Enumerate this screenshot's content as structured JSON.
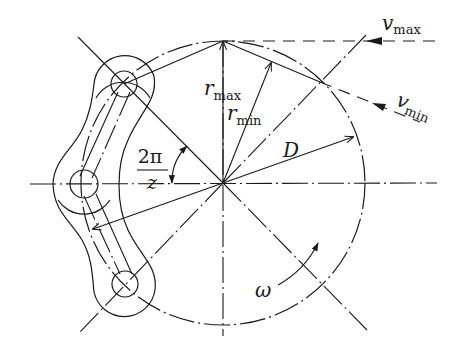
{
  "diagram": {
    "labels": {
      "r_max": {
        "base": "r",
        "sub": "max"
      },
      "r_min": {
        "base": "r",
        "sub": "min"
      },
      "v_max": {
        "base": "v",
        "sub": "max"
      },
      "v_min": {
        "base": "v",
        "sub": "min"
      },
      "D": "D",
      "omega": "ω",
      "angle_numerator": "2π",
      "angle_denominator": "z"
    },
    "colors": {
      "stroke": "#1a1a1a",
      "background": "#ffffff"
    }
  }
}
